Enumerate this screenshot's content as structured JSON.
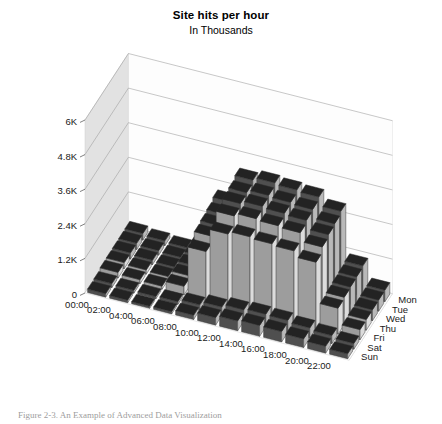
{
  "chart_data": {
    "type": "bar",
    "title": "Site hits per hour",
    "subtitle": "In Thousands",
    "xlabel": "",
    "ylabel": "",
    "zlabel": "",
    "grid": true,
    "legend": false,
    "projection": "3d-surface-bars",
    "ylim": [
      0,
      6000
    ],
    "yticks": [
      "0",
      "1.2K",
      "2.4K",
      "3.6K",
      "4.8K",
      "6K"
    ],
    "ytick_values": [
      0,
      1200,
      2400,
      3600,
      4800,
      6000
    ],
    "categories": [
      "00:00",
      "02:00",
      "04:00",
      "06:00",
      "08:00",
      "10:00",
      "12:00",
      "14:00",
      "16:00",
      "18:00",
      "20:00",
      "22:00"
    ],
    "series": [
      {
        "name": "Sun",
        "values": [
          120,
          90,
          70,
          80,
          150,
          260,
          340,
          380,
          360,
          300,
          240,
          170
        ]
      },
      {
        "name": "Sat",
        "values": [
          140,
          100,
          80,
          95,
          180,
          300,
          400,
          440,
          420,
          350,
          280,
          200
        ]
      },
      {
        "name": "Fri",
        "values": [
          200,
          140,
          110,
          300,
          1700,
          2500,
          2600,
          2550,
          2500,
          2300,
          900,
          350
        ]
      },
      {
        "name": "Thu",
        "values": [
          210,
          150,
          115,
          330,
          1900,
          2800,
          2900,
          2850,
          2800,
          2500,
          950,
          370
        ]
      },
      {
        "name": "Wed",
        "values": [
          215,
          155,
          120,
          340,
          1950,
          2900,
          3000,
          2950,
          2900,
          2600,
          980,
          380
        ]
      },
      {
        "name": "Tue",
        "values": [
          220,
          160,
          125,
          350,
          2000,
          2950,
          3050,
          3000,
          2950,
          2650,
          1000,
          390
        ]
      },
      {
        "name": "Mon",
        "values": [
          230,
          170,
          130,
          360,
          2100,
          3050,
          3150,
          3100,
          3050,
          2750,
          1050,
          400
        ]
      }
    ],
    "colors": {
      "bar_top": "#232323",
      "bar_front": "#4f4f4f",
      "bar_side": "#b9b9b9",
      "bar_front_light": "#9d9d9d",
      "wall_left": "#e2e2e2",
      "wall_back": "#fdfdfd",
      "floor": "#fefefe",
      "gridline": "#9a9a9a",
      "axis_text": "#1a1a1a"
    }
  },
  "caption": {
    "text": "Figure  2-3.   An Example of Advanced Data Visualization"
  }
}
